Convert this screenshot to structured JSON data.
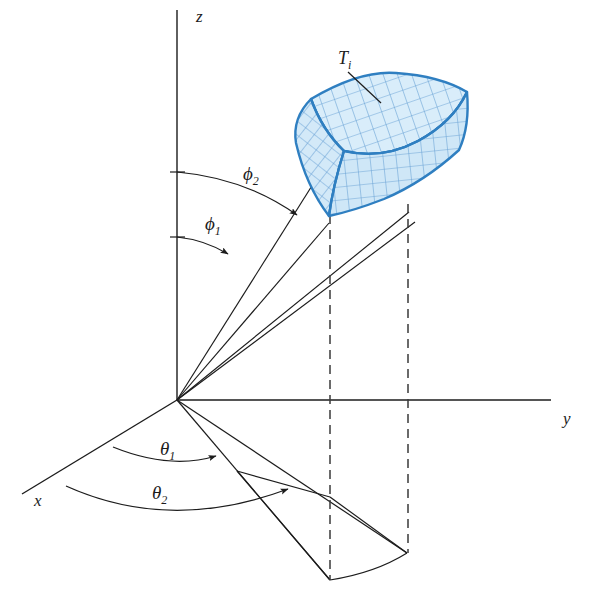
{
  "figure": {
    "type": "spherical-coordinate-volume-element-diagram",
    "background_color": "#ffffff"
  },
  "axes": {
    "z": {
      "label": "z",
      "label_x": 196,
      "label_y": 22,
      "from": [
        177,
        400
      ],
      "to": [
        177,
        10
      ]
    },
    "y": {
      "label": "y",
      "label_x": 563,
      "label_y": 424,
      "from": [
        177,
        400
      ],
      "to": [
        550,
        400
      ]
    },
    "x": {
      "label": "x",
      "label_x": 34,
      "label_y": 506,
      "from": [
        177,
        400
      ],
      "to": [
        22,
        495
      ]
    },
    "color": "#1c1c1c",
    "width": 1.3
  },
  "angles": {
    "phi1": {
      "label": "ϕ",
      "sub": "1",
      "label_x": 205,
      "label_y": 228,
      "description": "inner polar angle measured from the positive z-axis"
    },
    "phi2": {
      "label": "ϕ",
      "sub": "2",
      "label_x": 243,
      "label_y": 178,
      "description": "outer polar angle measured from the positive z-axis"
    },
    "theta1": {
      "label": "θ",
      "sub": "1",
      "label_x": 163,
      "label_y": 453,
      "description": "inner azimuthal angle measured from the positive x-axis"
    },
    "theta2": {
      "label": "θ",
      "sub": "2",
      "label_x": 155,
      "label_y": 497,
      "description": "outer azimuthal angle measured from the positive x-axis"
    }
  },
  "patch": {
    "label": "T",
    "sub": "i",
    "label_x": 345,
    "label_y": 62,
    "fill_color": "#d6ebf9",
    "grid_color": "#6ba3d6",
    "outline_color": "#2f7fc1",
    "description": "Curvilinear box-shaped volume element T sub i drawn with a blue mesh of coordinate curves."
  },
  "projection": {
    "description": "Dashed vertical lines drop from the element corners to the quadrilateral projection on the xy-plane.",
    "dash_color": "#3a3a3a",
    "dash_pattern": "9 6"
  },
  "rays": {
    "count": 4,
    "description": "Four straight rays from the origin to the corners of the volume element.",
    "color": "#1c1c1c"
  }
}
